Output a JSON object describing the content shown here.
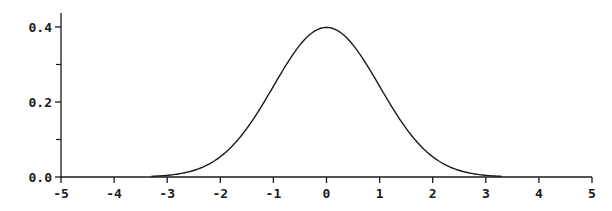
{
  "chart_data": {
    "type": "line",
    "title": "",
    "xlabel": "",
    "ylabel": "",
    "xlim": [
      -5,
      5
    ],
    "ylim": [
      0,
      0.4
    ],
    "grid": false,
    "legend": null,
    "x_ticks": [
      -5,
      -4,
      -3,
      -2,
      -1,
      0,
      1,
      2,
      3,
      4,
      5
    ],
    "x_tick_labels": [
      "-5",
      "-4",
      "-3",
      "-2",
      "-1",
      "0",
      "1",
      "2",
      "3",
      "4",
      "5"
    ],
    "y_major_ticks": [
      0.0,
      0.2,
      0.4
    ],
    "y_tick_labels": [
      "0.0",
      "0.2",
      "0.4"
    ],
    "y_minor_ticks": [
      0.1,
      0.3
    ],
    "series": [
      {
        "name": "Standard normal PDF",
        "function": "exp(-x^2/2)/sqrt(2*pi)",
        "x_range": [
          -3.3,
          3.3
        ],
        "x": [
          -3.3,
          -3.0,
          -2.5,
          -2.0,
          -1.5,
          -1.0,
          -0.5,
          0.0,
          0.5,
          1.0,
          1.5,
          2.0,
          2.5,
          3.0,
          3.3
        ],
        "values": [
          0.0017,
          0.0044,
          0.0175,
          0.054,
          0.1295,
          0.242,
          0.3521,
          0.3989,
          0.3521,
          0.242,
          0.1295,
          0.054,
          0.0175,
          0.0044,
          0.0017
        ]
      }
    ],
    "colors": {
      "line": "#1a1a1a",
      "axis": "#1a1a1a",
      "background": "#ffffff"
    }
  }
}
